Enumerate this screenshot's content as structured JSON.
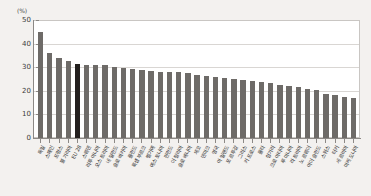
{
  "chart_data": {
    "type": "bar",
    "title": "",
    "subtitle": "",
    "xlabel": "",
    "ylabel": "(%)",
    "unit_label": "(%)",
    "ylim": [
      0,
      50
    ],
    "yticks": [
      50,
      40,
      30,
      20,
      10,
      0
    ],
    "grid": true,
    "legend": null,
    "highlight_category": "EU 28",
    "highlight_color": "#231f1e",
    "bar_color": "#6e6b68",
    "plot_background": "#ffffff",
    "page_background": "#f3f1ef",
    "categories": [
      "독일",
      "스페인",
      "프랑스",
      "불가리아",
      "EU 28",
      "스웨덴",
      "리투아니아",
      "오스트리아",
      "네덜란드",
      "슬로바키아",
      "폴란드",
      "룩셈부르크",
      "벨기에",
      "에스토니아",
      "핀란드",
      "이탈리아",
      "슬로베니아",
      "체코",
      "덴마크",
      "영국",
      "아일랜드",
      "포르투갈",
      "그리스",
      "키프로스",
      "몰타",
      "헝가리",
      "크로아티아",
      "루마니아",
      "라트비아",
      "노르웨이",
      "아이슬란드",
      "스위스",
      "터키",
      "세르비아",
      "마케도니아"
    ],
    "values": [
      45.5,
      36.3,
      34.0,
      33.0,
      31.6,
      31.4,
      31.4,
      31.4,
      30.2,
      30.0,
      29.6,
      29.0,
      28.6,
      28.4,
      28.3,
      28.0,
      27.6,
      27.1,
      26.6,
      26.1,
      25.7,
      25.3,
      25.0,
      24.4,
      23.8,
      23.3,
      22.8,
      22.2,
      21.6,
      21.0,
      20.6,
      19.0,
      18.4,
      17.6,
      17.2
    ]
  }
}
